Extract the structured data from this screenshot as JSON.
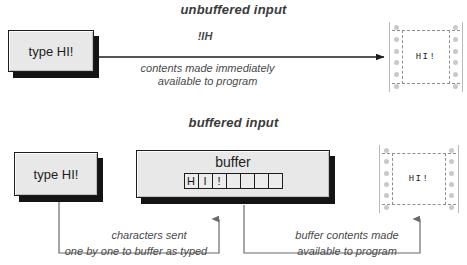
{
  "diagram": {
    "sections": [
      {
        "id": "unbuffered",
        "title": "unbuffered input",
        "input_box": {
          "label": "type HI!"
        },
        "flow_label_top": "!IH",
        "flow_label_line1": "contents made immediately",
        "flow_label_line2": "available to program",
        "output": {
          "text": "HI!"
        }
      },
      {
        "id": "buffered",
        "title": "buffered input",
        "input_box": {
          "label": "type HI!"
        },
        "buffer": {
          "title": "buffer",
          "cells": [
            "H",
            "I",
            "!",
            "",
            "",
            "",
            ""
          ]
        },
        "annotation_left_line1": "characters sent",
        "annotation_left_line2": "one by one to buffer as typed",
        "annotation_right_line1": "buffer contents made",
        "annotation_right_line2": "available to program",
        "output": {
          "text": "HI!"
        }
      }
    ],
    "colors": {
      "ink": "#1d1d1d",
      "box_face": "#e8e8e8",
      "box_shadow": "#141414",
      "annotation": "#4a4a4a",
      "paper_hole": "#c9c9c9",
      "paper_perf": "#8e8e8e"
    }
  }
}
